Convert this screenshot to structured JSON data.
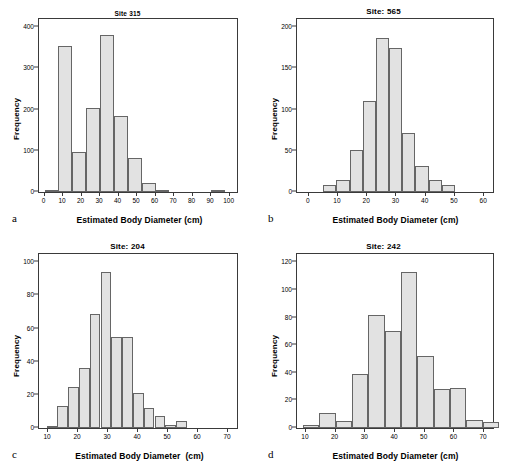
{
  "figure": {
    "shared_xlabel": "Estimated Body Diameter (cm)",
    "shared_ylabel": "Frequency",
    "bar_fill": "#e2e2e2",
    "bar_stroke": "#666666",
    "axis_color": "#3a3a3a"
  },
  "panels": [
    {
      "letter": "a",
      "title": "Site 315",
      "xlabel": "Estimated Body Diameter (cm)",
      "ylabel": "Frequency"
    },
    {
      "letter": "b",
      "title": "Site: 565",
      "xlabel": "Estimated Body Diameter (cm)",
      "ylabel": "Frequency"
    },
    {
      "letter": "c",
      "title": "Site: 204",
      "xlabel": "Estimated Body Diameter  (cm)",
      "ylabel": "Frequency"
    },
    {
      "letter": "d",
      "title": "Site: 242",
      "xlabel": "Estimated Body Diameter (cm)",
      "ylabel": "Frequency"
    }
  ],
  "chart_data": [
    {
      "type": "bar",
      "title": "Site 315",
      "xlabel": "Estimated Body Diameter (cm)",
      "ylabel": "Frequency",
      "xlim": [
        -3,
        104
      ],
      "ylim": [
        0,
        420
      ],
      "xticks": [
        0,
        10,
        20,
        30,
        40,
        50,
        60,
        70,
        80,
        90,
        100
      ],
      "yticks": [
        0,
        100,
        200,
        300,
        400
      ],
      "grid": false,
      "legend": "none",
      "bin_width": 7.5,
      "bin_edges": [
        0,
        7.5,
        15,
        22.5,
        30,
        37.5,
        45,
        52.5,
        90,
        97.5
      ],
      "bars": [
        {
          "x0": 0.0,
          "x1": 7.5,
          "value": 4
        },
        {
          "x0": 7.5,
          "x1": 15.0,
          "value": 355
        },
        {
          "x0": 15.0,
          "x1": 22.5,
          "value": 98
        },
        {
          "x0": 22.5,
          "x1": 30.0,
          "value": 205
        },
        {
          "x0": 30.0,
          "x1": 37.5,
          "value": 381
        },
        {
          "x0": 37.5,
          "x1": 45.0,
          "value": 184
        },
        {
          "x0": 45.0,
          "x1": 52.5,
          "value": 83
        },
        {
          "x0": 52.5,
          "x1": 60.0,
          "value": 21
        },
        {
          "x0": 60.0,
          "x1": 67.5,
          "value": 3
        },
        {
          "x0": 90.0,
          "x1": 97.5,
          "value": 2
        }
      ]
    },
    {
      "type": "bar",
      "title": "Site: 565",
      "xlabel": "Estimated Body Diameter (cm)",
      "ylabel": "Frequency",
      "xlim": [
        -4,
        63
      ],
      "ylim": [
        0,
        210
      ],
      "xticks": [
        0,
        10,
        20,
        30,
        40,
        50,
        60
      ],
      "yticks": [
        0,
        50,
        100,
        150,
        200
      ],
      "grid": false,
      "legend": "none",
      "bin_width": 4.5,
      "bars": [
        {
          "x0": 5.0,
          "x1": 9.5,
          "value": 8
        },
        {
          "x0": 9.5,
          "x1": 14.0,
          "value": 15
        },
        {
          "x0": 14.0,
          "x1": 18.5,
          "value": 51
        },
        {
          "x0": 18.5,
          "x1": 23.0,
          "value": 110
        },
        {
          "x0": 23.0,
          "x1": 27.5,
          "value": 187
        },
        {
          "x0": 27.5,
          "x1": 32.0,
          "value": 175
        },
        {
          "x0": 32.0,
          "x1": 36.5,
          "value": 72
        },
        {
          "x0": 36.5,
          "x1": 41.0,
          "value": 31
        },
        {
          "x0": 41.0,
          "x1": 45.5,
          "value": 15
        },
        {
          "x0": 45.5,
          "x1": 50.0,
          "value": 9
        }
      ]
    },
    {
      "type": "bar",
      "title": "Site: 204",
      "xlabel": "Estimated Body Diameter  (cm)",
      "ylabel": "Frequency",
      "xlim": [
        7,
        73
      ],
      "ylim": [
        0,
        105
      ],
      "xticks": [
        10,
        20,
        30,
        40,
        50,
        60,
        70
      ],
      "yticks": [
        0,
        20,
        40,
        60,
        80,
        100
      ],
      "grid": false,
      "legend": "none",
      "bin_width": 3.6,
      "bars": [
        {
          "x0": 9.5,
          "x1": 13.1,
          "value": 1
        },
        {
          "x0": 13.1,
          "x1": 16.7,
          "value": 13
        },
        {
          "x0": 16.7,
          "x1": 20.3,
          "value": 25
        },
        {
          "x0": 20.3,
          "x1": 23.9,
          "value": 36
        },
        {
          "x0": 23.9,
          "x1": 27.5,
          "value": 69
        },
        {
          "x0": 27.5,
          "x1": 31.1,
          "value": 94
        },
        {
          "x0": 31.1,
          "x1": 34.7,
          "value": 55
        },
        {
          "x0": 34.7,
          "x1": 38.3,
          "value": 55
        },
        {
          "x0": 38.3,
          "x1": 41.9,
          "value": 21
        },
        {
          "x0": 41.9,
          "x1": 45.5,
          "value": 12
        },
        {
          "x0": 45.5,
          "x1": 49.1,
          "value": 7
        },
        {
          "x0": 49.1,
          "x1": 52.7,
          "value": 2
        },
        {
          "x0": 52.7,
          "x1": 56.3,
          "value": 4
        }
      ]
    },
    {
      "type": "bar",
      "title": "Site: 242",
      "xlabel": "Estimated Body Diameter (cm)",
      "ylabel": "Frequency",
      "xlim": [
        7,
        73
      ],
      "ylim": [
        0,
        126
      ],
      "xticks": [
        10,
        20,
        30,
        40,
        50,
        60,
        70
      ],
      "yticks": [
        0,
        20,
        40,
        60,
        80,
        100,
        120
      ],
      "grid": false,
      "legend": "none",
      "bin_width": 5.5,
      "bars": [
        {
          "x0": 9.0,
          "x1": 14.5,
          "value": 2
        },
        {
          "x0": 14.5,
          "x1": 20.0,
          "value": 11
        },
        {
          "x0": 20.0,
          "x1": 25.5,
          "value": 5
        },
        {
          "x0": 25.5,
          "x1": 31.0,
          "value": 39
        },
        {
          "x0": 31.0,
          "x1": 36.5,
          "value": 82
        },
        {
          "x0": 36.5,
          "x1": 42.0,
          "value": 70
        },
        {
          "x0": 42.0,
          "x1": 47.5,
          "value": 113
        },
        {
          "x0": 47.5,
          "x1": 53.0,
          "value": 52
        },
        {
          "x0": 53.0,
          "x1": 58.5,
          "value": 28
        },
        {
          "x0": 58.5,
          "x1": 64.0,
          "value": 29
        },
        {
          "x0": 64.0,
          "x1": 69.5,
          "value": 6
        },
        {
          "x0": 69.5,
          "x1": 75.0,
          "value": 4
        }
      ]
    }
  ]
}
